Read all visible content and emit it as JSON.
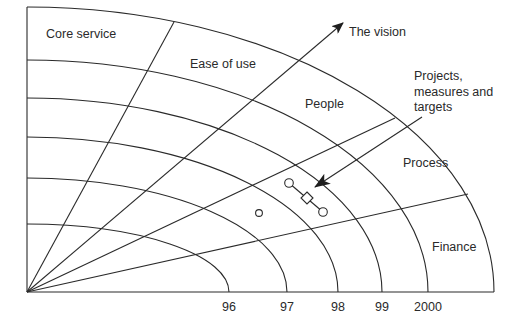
{
  "diagram": {
    "origin": [
      27,
      292
    ],
    "x_axis_end": 494,
    "y_axis_top": 7,
    "ink_color": "#2a2a2a",
    "background": "#ffffff"
  },
  "arcs": [
    {
      "label": "96",
      "rx": 202,
      "ry": 68,
      "tick_x": 229
    },
    {
      "label": "97",
      "rx": 260,
      "ry": 114,
      "tick_x": 287
    },
    {
      "label": "98",
      "rx": 311,
      "ry": 155,
      "tick_x": 338
    },
    {
      "label": "99",
      "rx": 355,
      "ry": 194,
      "tick_x": 382
    },
    {
      "label": "2000",
      "rx": 401,
      "ry": 232,
      "tick_x": 428
    },
    {
      "label": "",
      "rx": 467,
      "ry": 285,
      "tick_x": 494
    }
  ],
  "radials": [
    {
      "name": "core-ease-divider",
      "end": [
        174,
        22
      ]
    },
    {
      "name": "people-process-divider",
      "end": [
        395,
        118
      ]
    },
    {
      "name": "process-finance-divider",
      "end": [
        468,
        194
      ]
    }
  ],
  "sectors": [
    {
      "label": "Core service",
      "x": 46,
      "y": 38
    },
    {
      "label": "Ease of use",
      "x": 190,
      "y": 68
    },
    {
      "label": "People",
      "x": 305,
      "y": 108
    },
    {
      "label": "Process",
      "x": 403,
      "y": 167
    },
    {
      "label": "Finance",
      "x": 432,
      "y": 251
    }
  ],
  "vision_arrow": {
    "label": "The vision",
    "start": [
      27,
      292
    ],
    "end": [
      343,
      23
    ],
    "label_x": 349,
    "label_y": 36
  },
  "projects_annotation": {
    "lines": [
      "Projects,",
      "measures and",
      "targets"
    ],
    "x": 414,
    "y": 80,
    "line_height": 15.5,
    "arrow_start": [
      422,
      117
    ],
    "arrow_end": [
      315,
      187
    ]
  },
  "markers": {
    "circles": [
      {
        "cx": 289,
        "cy": 183,
        "r": 4.3
      },
      {
        "cx": 323,
        "cy": 212,
        "r": 4.3
      },
      {
        "cx": 259,
        "cy": 213,
        "r": 3.4
      }
    ],
    "diamond": {
      "cx": 307,
      "cy": 198,
      "half": 6
    },
    "connector": [
      [
        289,
        183
      ],
      [
        323,
        212
      ]
    ]
  },
  "x_axis_ticks": [
    "96",
    "97",
    "98",
    "99",
    "2000"
  ]
}
